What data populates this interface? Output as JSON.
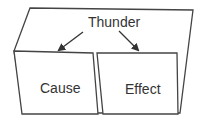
{
  "diagram": {
    "type": "foldable-organizer",
    "title": "Thunder",
    "left_flap": {
      "label": "Cause"
    },
    "right_flap": {
      "label": "Effect"
    },
    "arrows": [
      {
        "from": "Thunder",
        "to": "Cause"
      },
      {
        "from": "Thunder",
        "to": "Effect"
      }
    ],
    "colors": {
      "stroke": "#333333",
      "background": "#ffffff",
      "text": "#333333"
    }
  }
}
